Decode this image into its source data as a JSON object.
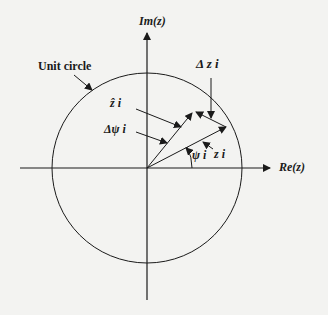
{
  "diagram": {
    "axes": {
      "imag_label": "Im(z)",
      "real_label": "Re(z)"
    },
    "labels": {
      "unit_circle": "Unit circle",
      "delta_z": "Δ z i",
      "z_hat": "ẑ i",
      "delta_psi": "Δψ i",
      "psi": "ψ i",
      "z": "z i"
    },
    "colors": {
      "stroke": "#1a1a1a",
      "background": "#f3f3f1"
    }
  }
}
